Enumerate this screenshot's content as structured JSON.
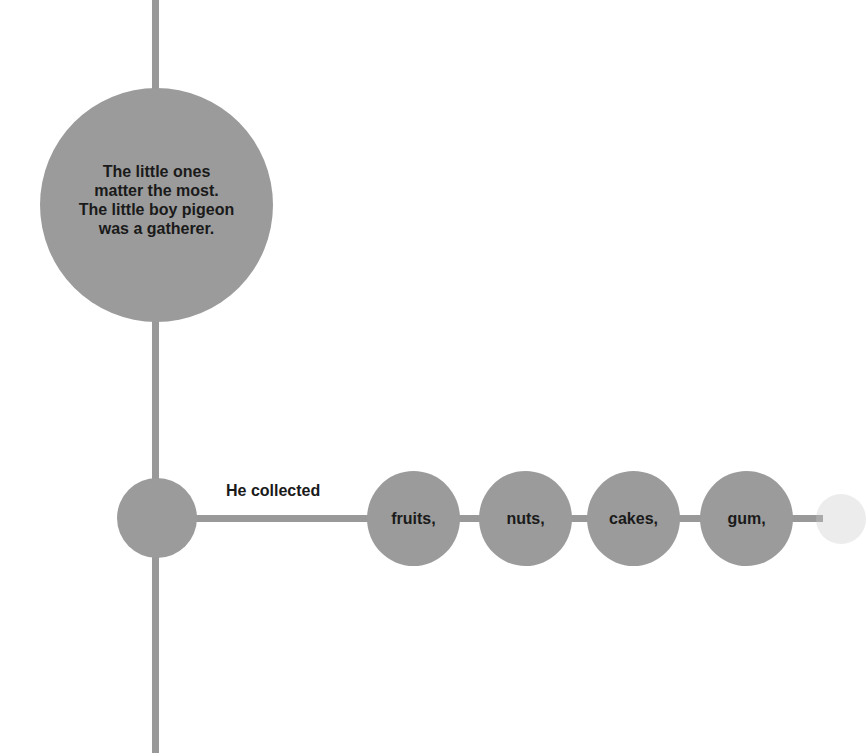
{
  "diagram": {
    "main_bubble": {
      "text": "The little ones\nmatter the most.\nThe little boy pigeon\nwas a gatherer."
    },
    "branch_label": "He collected",
    "items": [
      {
        "label": "fruits,"
      },
      {
        "label": "nuts,"
      },
      {
        "label": "cakes,"
      },
      {
        "label": "gum,"
      }
    ],
    "colors": {
      "node": "#9b9b9b",
      "line": "#999999",
      "text": "#1a1a1a",
      "background": "#ffffff"
    }
  }
}
